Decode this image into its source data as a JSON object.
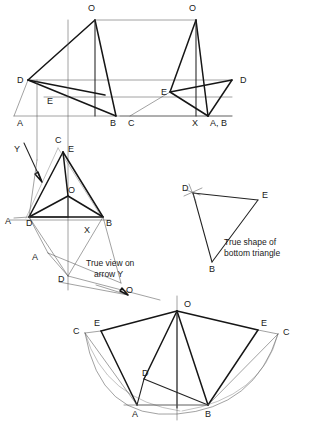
{
  "document": {
    "type": "engineering-drawing",
    "title": "Auxiliary projection of a pentagonal pyramid",
    "background_color": "#ffffff",
    "line_color": "#161616",
    "thin_line_color": "#777777",
    "width": 315,
    "height": 423
  },
  "annotations": {
    "true_view_note_line1": "True view on",
    "true_view_note_line2": "arrow Y",
    "true_shape_note_line1": "True shape of",
    "true_shape_note_line2": "bottom triangle",
    "arrow_label": "Y"
  },
  "views": {
    "front_elevation": {
      "name": "front-elevation",
      "labels": [
        {
          "text": "O",
          "x": 88,
          "y": 11
        },
        {
          "text": "D",
          "x": 17,
          "y": 83
        },
        {
          "text": "E",
          "x": 47,
          "y": 104
        },
        {
          "text": "A",
          "x": 17,
          "y": 122
        },
        {
          "text": "B",
          "x": 110,
          "y": 122
        }
      ]
    },
    "end_elevation": {
      "name": "end-elevation",
      "labels": [
        {
          "text": "O",
          "x": 189,
          "y": 11
        },
        {
          "text": "D",
          "x": 240,
          "y": 83
        },
        {
          "text": "E",
          "x": 161,
          "y": 92
        },
        {
          "text": "C",
          "x": 128,
          "y": 122
        },
        {
          "text": "X",
          "x": 192,
          "y": 122
        },
        {
          "text": "A, B",
          "x": 213,
          "y": 122
        }
      ]
    },
    "auxiliary_view": {
      "name": "true-view-on-arrow-y",
      "labels": [
        {
          "text": "C",
          "x": 55,
          "y": 143
        },
        {
          "text": "E",
          "x": 67,
          "y": 151
        },
        {
          "text": "O",
          "x": 66,
          "y": 191
        },
        {
          "text": "A",
          "x": 5,
          "y": 222
        },
        {
          "text": "D",
          "x": 26,
          "y": 224
        },
        {
          "text": "X",
          "x": 84,
          "y": 231
        },
        {
          "text": "B",
          "x": 108,
          "y": 224
        },
        {
          "text": "A",
          "x": 32,
          "y": 258
        },
        {
          "text": "D",
          "x": 58,
          "y": 279
        },
        {
          "text": "O",
          "x": 126,
          "y": 290
        }
      ]
    },
    "true_shape_view": {
      "name": "true-shape-of-bottom-triangle",
      "labels": [
        {
          "text": "D",
          "x": 185,
          "y": 189
        },
        {
          "text": "E",
          "x": 262,
          "y": 195
        },
        {
          "text": "B",
          "x": 215,
          "y": 268
        }
      ]
    },
    "development_view": {
      "name": "surface-development",
      "labels": [
        {
          "text": "O",
          "x": 186,
          "y": 304
        },
        {
          "text": "E",
          "x": 95,
          "y": 323
        },
        {
          "text": "C",
          "x": 73,
          "y": 330
        },
        {
          "text": "E",
          "x": 264,
          "y": 323
        },
        {
          "text": "C",
          "x": 284,
          "y": 331
        },
        {
          "text": "D",
          "x": 144,
          "y": 372
        },
        {
          "text": "A",
          "x": 130,
          "y": 412
        },
        {
          "text": "B",
          "x": 222,
          "y": 412
        }
      ]
    }
  }
}
